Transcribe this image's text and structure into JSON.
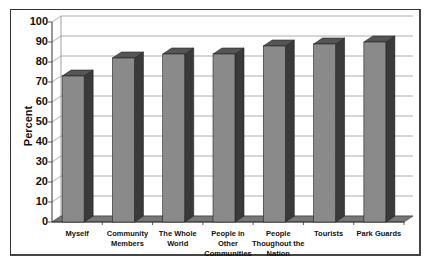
{
  "chart_data": {
    "type": "bar",
    "title": "",
    "xlabel": "",
    "ylabel": "Percent",
    "ylim": [
      0,
      100
    ],
    "yticks": [
      0,
      10,
      20,
      30,
      40,
      50,
      60,
      70,
      80,
      90,
      100
    ],
    "grid": true,
    "style": "3d",
    "categories": [
      "Myself",
      "Community Members",
      "The Whole World",
      "People in Other Communities",
      "People Thoughout the Nation",
      "Tourists",
      "Park Guards"
    ],
    "category_lines": [
      [
        "Myself"
      ],
      [
        "Community",
        "Members"
      ],
      [
        "The Whole",
        "World"
      ],
      [
        "People in",
        "Other",
        "Communities"
      ],
      [
        "People",
        "Thoughout the",
        "Nation"
      ],
      [
        "Tourists"
      ],
      [
        "Park Guards"
      ]
    ],
    "values": [
      73,
      82,
      84,
      84,
      88,
      89,
      90
    ],
    "colors": {
      "bar_front": "#8a8a8a",
      "bar_side": "#3a3a3a",
      "bar_top": "#555555",
      "grid": "#999999"
    }
  }
}
